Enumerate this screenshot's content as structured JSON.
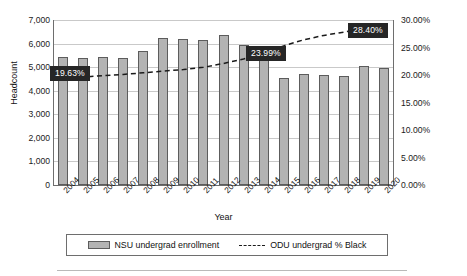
{
  "axes": {
    "y_left_title": "Headcount",
    "x_title": "Year",
    "y_left_ticks": [
      "7,000",
      "6,000",
      "5,000",
      "4,000",
      "3,000",
      "2,000",
      "1,000",
      "0"
    ],
    "y_right_ticks": [
      "30.00%",
      "25.00%",
      "20.00%",
      "15.00%",
      "10.00%",
      "5.00%",
      "0.00%"
    ]
  },
  "legend": {
    "bar_label": "NSU undergrad enrollment",
    "line_label": "ODU undergrad % Black"
  },
  "callouts": [
    {
      "name": "callout-2005",
      "text": "19.63%"
    },
    {
      "name": "callout-2014",
      "text": "23.99%"
    },
    {
      "name": "callout-2019",
      "text": "28.40%"
    }
  ],
  "colors": {
    "bar_fill": "#b3b3b3",
    "bar_stroke": "#5c5c5c",
    "line": "#1b1b1b",
    "grid": "#c9c9c9",
    "callout_bg": "#262626",
    "callout_text": "#ffffff"
  },
  "chart_data": {
    "type": "bar",
    "title": "",
    "xlabel": "Year",
    "ylabel": "Headcount",
    "grid": true,
    "legend_position": "bottom",
    "categories": [
      "2004",
      "2005",
      "2006",
      "2007",
      "2008",
      "2009",
      "2010",
      "2011",
      "2012",
      "2013",
      "2014",
      "2015",
      "2016",
      "2017",
      "2018",
      "2019",
      "2020"
    ],
    "ylim": [
      0,
      7000
    ],
    "y2lim": [
      0,
      30
    ],
    "y2label": "Percent",
    "series": [
      {
        "name": "NSU undergrad enrollment",
        "type": "bar",
        "axis": "left",
        "values": [
          5430,
          5380,
          5430,
          5400,
          5680,
          6250,
          6180,
          6150,
          6380,
          5930,
          5830,
          4540,
          4720,
          4680,
          4630,
          5060,
          4980
        ]
      },
      {
        "name": "ODU undergrad % Black",
        "type": "line",
        "style": "dashed",
        "axis": "right",
        "values": [
          19.4,
          19.63,
          19.9,
          20.1,
          20.4,
          20.7,
          21.0,
          21.4,
          22.1,
          22.9,
          23.99,
          25.3,
          26.4,
          27.2,
          27.8,
          28.4,
          28.4
        ]
      }
    ],
    "annotations": [
      {
        "category": "2005",
        "series": "ODU undergrad % Black",
        "text": "19.63%"
      },
      {
        "category": "2014",
        "series": "ODU undergrad % Black",
        "text": "23.99%"
      },
      {
        "category": "2019",
        "series": "ODU undergrad % Black",
        "text": "28.40%"
      }
    ]
  }
}
